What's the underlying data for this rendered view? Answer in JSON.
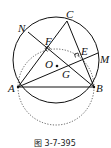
{
  "figure": {
    "caption": "图 3-7-395",
    "points": {
      "A": "A",
      "B": "B",
      "C": "C",
      "N": "N",
      "M": "M",
      "F": "F",
      "E": "E",
      "O": "O",
      "G": "G"
    }
  }
}
